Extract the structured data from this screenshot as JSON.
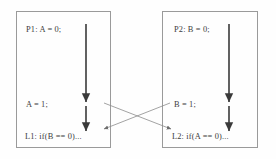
{
  "diagram": {
    "background_color": "#fefefe",
    "box_border_color": "#9a9a9a",
    "arrow_color": "#3a3a3a",
    "cross_arrow_color": "#8c8c8c",
    "text_color": "#3d3d3d"
  },
  "processes": [
    {
      "id": "P1",
      "statements": [
        {
          "key": "init",
          "text": "P1: A = 0;"
        },
        {
          "key": "assign",
          "text": "A = 1;"
        },
        {
          "key": "label",
          "text": "L1: if(B == 0)..."
        }
      ]
    },
    {
      "id": "P2",
      "statements": [
        {
          "key": "init",
          "text": "P2: B = 0;"
        },
        {
          "key": "assign",
          "text": "B = 1;"
        },
        {
          "key": "label",
          "text": "L2: if(A == 0)..."
        }
      ]
    }
  ],
  "flow_arrows": [
    {
      "name": "p1-flow-upper",
      "from": [
        86,
        24
      ],
      "to": [
        86,
        102
      ]
    },
    {
      "name": "p1-flow-lower",
      "from": [
        86,
        106
      ],
      "to": [
        86,
        131
      ]
    },
    {
      "name": "p2-flow-upper",
      "from": [
        229,
        24
      ],
      "to": [
        229,
        102
      ]
    },
    {
      "name": "p2-flow-lower",
      "from": [
        229,
        106
      ],
      "to": [
        229,
        131
      ]
    }
  ],
  "cross_arrows": [
    {
      "name": "a1-to-l2",
      "from": [
        104,
        103
      ],
      "to": [
        171,
        129
      ]
    },
    {
      "name": "b1-to-l1",
      "from": [
        170,
        103
      ],
      "to": [
        104,
        129
      ]
    }
  ]
}
